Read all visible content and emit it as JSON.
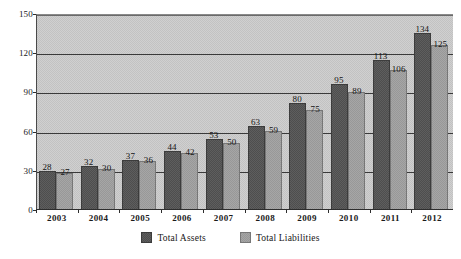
{
  "chart_data": {
    "type": "bar",
    "title": "",
    "subtitle": "",
    "xlabel": "",
    "ylabel": "",
    "categories": [
      "2003",
      "2004",
      "2005",
      "2006",
      "2007",
      "2008",
      "2009",
      "2010",
      "2011",
      "2012"
    ],
    "series": [
      {
        "name": "Total Assets",
        "color": "#4e4e4e",
        "values": [
          28,
          32,
          37,
          44,
          53,
          63,
          80,
          95,
          113,
          134
        ]
      },
      {
        "name": "Total Liabilities",
        "color": "#989898",
        "values": [
          27,
          30,
          36,
          42,
          50,
          59,
          75,
          89,
          106,
          125
        ]
      }
    ],
    "ylim": [
      0,
      150
    ],
    "yticks": [
      "0",
      "30",
      "60",
      "90",
      "120",
      "150"
    ],
    "ytick_values": [
      0,
      30,
      60,
      90,
      120,
      150
    ],
    "grid": true,
    "grid_axis": "y",
    "legend_position": "bottom",
    "data_labels": true,
    "plot_background": "#c8c8c8",
    "page_background": "#ffffff"
  },
  "legend": {
    "items": [
      {
        "label": "Total Assets",
        "swatch": "assets"
      },
      {
        "label": "Total Liabilities",
        "swatch": "liab"
      }
    ]
  }
}
